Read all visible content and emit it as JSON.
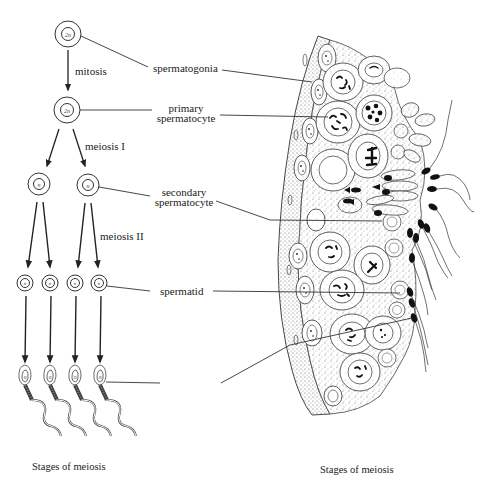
{
  "diagram": {
    "left_panel": {
      "cells": [
        {
          "stage": "spermatogonia",
          "ploidy": "2n"
        },
        {
          "stage": "primary spermatocyte",
          "ploidy": "2n"
        },
        {
          "stage": "secondary spermatocyte",
          "ploidy": "n",
          "count": 2
        },
        {
          "stage": "spermatid",
          "ploidy": "n",
          "count": 4
        },
        {
          "stage": "sperm",
          "ploidy": "n",
          "count": 4
        }
      ],
      "ploidy_labels": {
        "diploid": "2n",
        "haploid": "n"
      },
      "process_labels": {
        "mitosis": "mitosis",
        "meiosis1": "meiosis I",
        "meiosis2": "meiosis II"
      },
      "caption": "Stages of meiosis"
    },
    "stage_labels": {
      "spermatogonia": "spermatogonia",
      "primary_line1": "primary",
      "primary_line2": "spermatocyte",
      "secondary_line1": "secondary",
      "secondary_line2": "spermatocyte",
      "spermatid": "spermatid"
    },
    "right_panel": {
      "description": "Cross-section of seminiferous tubule wall showing cells at successive stages of spermatogenesis",
      "caption": "Stages of meiosis"
    }
  }
}
